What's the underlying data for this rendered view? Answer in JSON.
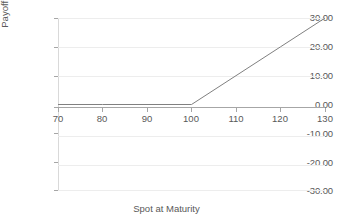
{
  "chart_data": {
    "type": "line",
    "title": "",
    "xlabel": "Spot at Maturity",
    "ylabel": "Payoff (CCY2 per CCY1)",
    "xlim": [
      70,
      130
    ],
    "ylim": [
      -30,
      30
    ],
    "xticks": [
      70,
      80,
      90,
      100,
      110,
      120,
      130
    ],
    "yticks": [
      30,
      20,
      10,
      0,
      -10,
      -20,
      -30
    ],
    "xtick_labels": [
      "70",
      "80",
      "90",
      "100",
      "110",
      "120",
      "130"
    ],
    "ytick_labels": [
      "30.00",
      "20.00",
      "10.00",
      "0.00",
      "-10.00",
      "-20.00",
      "-30.00"
    ],
    "grid": true,
    "grid_axis": "y",
    "legend": "none",
    "series": [
      {
        "name": "Call payoff",
        "color": "#808080",
        "line_width": 1,
        "x": [
          70,
          80,
          90,
          100,
          110,
          120,
          130
        ],
        "values": [
          0,
          0,
          0,
          0,
          10,
          20,
          30
        ]
      }
    ],
    "annotations": {
      "strike": 100,
      "kink_point": [
        100,
        0
      ]
    }
  },
  "colors": {
    "line": "#808080",
    "gridline": "#ededed",
    "axis": "#a6a6a6",
    "text": "#595959",
    "background": "#ffffff"
  }
}
